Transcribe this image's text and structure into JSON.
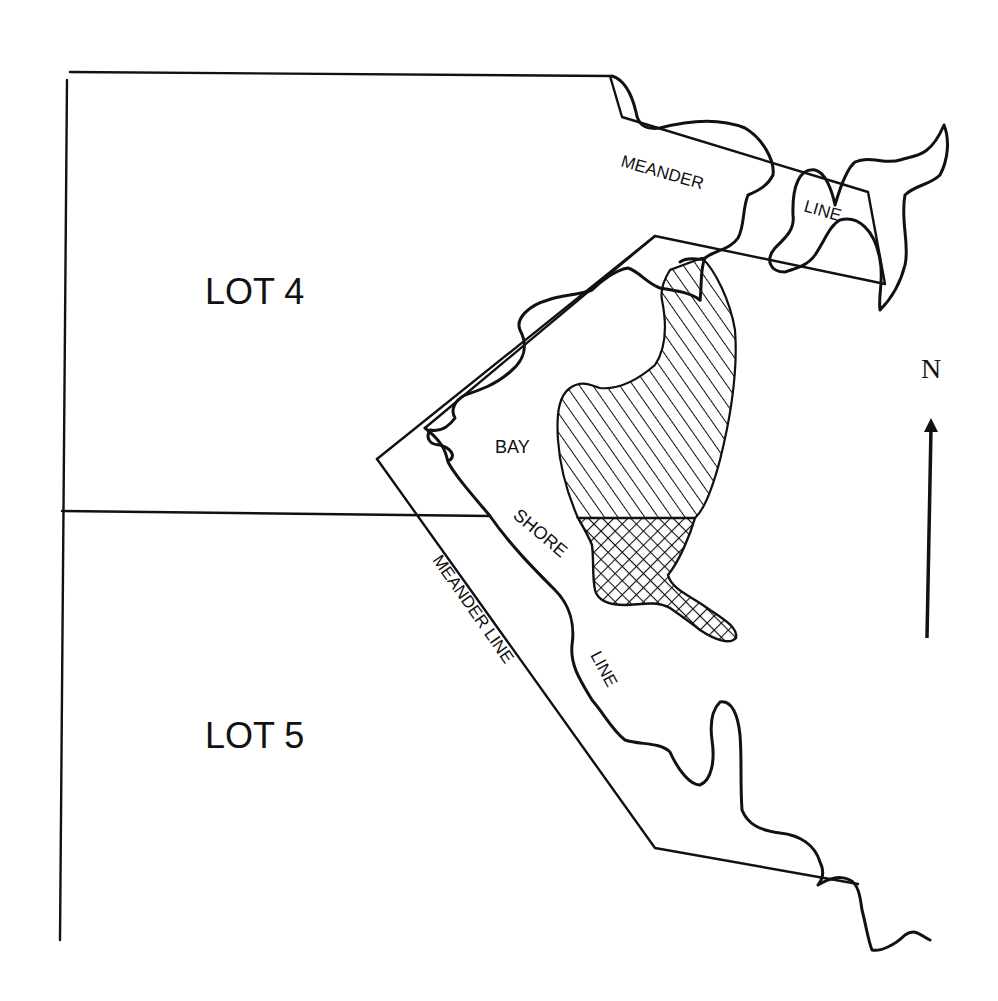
{
  "map": {
    "lots": [
      {
        "label": "LOT 4"
      },
      {
        "label": "LOT 5"
      }
    ],
    "water_labels": {
      "bay": "BAY",
      "shore": "SHORE",
      "line": "LINE"
    },
    "meander_labels": {
      "north_part1": "MEANDER",
      "north_part2": "LINE",
      "west": "MEANDER LINE"
    },
    "north_arrow": {
      "label": "N",
      "icon": "north-arrow-icon"
    },
    "legend_areas": [
      {
        "name": "diagonal-hatched-area",
        "pattern": "diagonal"
      },
      {
        "name": "cross-hatched-area",
        "pattern": "crosshatch"
      }
    ],
    "colors": {
      "ink": "#111111",
      "paper": "#ffffff"
    }
  }
}
